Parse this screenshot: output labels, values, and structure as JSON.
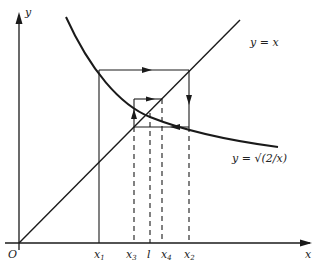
{
  "diagram": {
    "axes": {
      "x_label": "x",
      "y_label": "y",
      "origin_label": "O"
    },
    "curves": [
      {
        "name": "line",
        "label": "y = x"
      },
      {
        "name": "curve",
        "label": "y = √(2/x)"
      }
    ],
    "x_ticks": [
      {
        "base": "x",
        "sub": "1"
      },
      {
        "base": "x",
        "sub": "3"
      },
      {
        "base": "l",
        "sub": ""
      },
      {
        "base": "x",
        "sub": "4"
      },
      {
        "base": "x",
        "sub": "2"
      }
    ],
    "colors": {
      "line": "#1a1a1a",
      "background": "#ffffff"
    }
  }
}
